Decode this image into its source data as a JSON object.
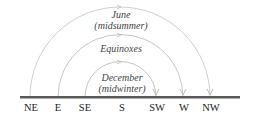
{
  "diagram": {
    "arcs": [
      {
        "name": "june",
        "label_line1": "June",
        "label_line2": "(midsummer)",
        "start": "NE",
        "end": "NW"
      },
      {
        "name": "equinoxes",
        "label_line1": "Equinoxes",
        "start": "E",
        "end": "W"
      },
      {
        "name": "december",
        "label_line1": "December",
        "label_line2": "(midwinter)",
        "start": "SE",
        "end": "SW"
      }
    ],
    "directions": [
      "NE",
      "E",
      "SE",
      "S",
      "SW",
      "W",
      "NW"
    ],
    "colors": {
      "arc": "#c8c8c8",
      "horizon": "#555555",
      "text": "#333333"
    }
  }
}
